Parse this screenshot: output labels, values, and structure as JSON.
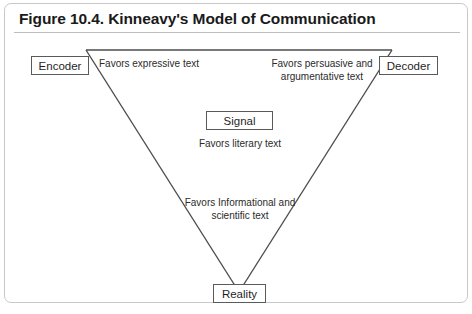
{
  "figure": {
    "title": "Figure 10.4. Kinneavy's Model of Communication"
  },
  "diagram": {
    "type": "communication-triangle",
    "nodes": [
      {
        "id": "encoder",
        "label": "Encoder"
      },
      {
        "id": "decoder",
        "label": "Decoder"
      },
      {
        "id": "signal",
        "label": "Signal"
      },
      {
        "id": "reality",
        "label": "Reality"
      }
    ],
    "captions": [
      {
        "id": "expressive",
        "text": "Favors expressive text"
      },
      {
        "id": "persuasive",
        "text": "Favors persuasive and argumentative text"
      },
      {
        "id": "literary",
        "text": "Favors literary text"
      },
      {
        "id": "informational",
        "text": "Favors Informational and scientific text"
      }
    ],
    "colors": {
      "line": "#4d4d4d",
      "box_border": "#5a5a5a",
      "card_border": "#c9c9c9",
      "text": "#1f1f1f",
      "background": "#ffffff"
    }
  }
}
